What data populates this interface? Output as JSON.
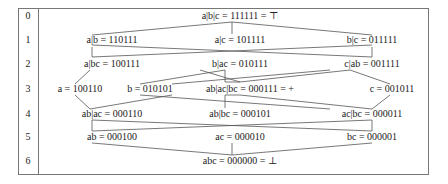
{
  "rows": [
    "0",
    "1",
    "2",
    "3",
    "4",
    "5",
    "6"
  ],
  "nodes": {
    "top": "a|b|c = 111111  = ⊤",
    "r1_left": "a|b = 110111",
    "r1_center": "a|c = 101111",
    "r1_right": "b|c = 011111",
    "r2_left": "a|bc = 100111",
    "r2_center": "b|ac = 010111",
    "r2_right": "c|ab = 001111",
    "r3_a": "a = 100110",
    "r3_b": "b = 010101",
    "r3_center": "ab|ac|bc = 000111  = +",
    "r3_c": "c = 001011",
    "r4_left": "ab|ac = 000110",
    "r4_center": "ab|bc = 000101",
    "r4_right": "ac|bc = 000011",
    "r5_left": "ab = 000100",
    "r5_center": "ac = 000010",
    "r5_right": "bc = 000001",
    "bottom": "abc = 000000  = ⊥"
  },
  "colors": {
    "line": "#555555",
    "border": "#777777",
    "text": "#222222"
  }
}
